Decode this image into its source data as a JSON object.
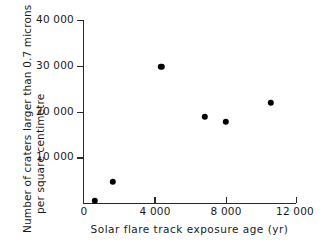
{
  "chart_data": {
    "type": "scatter",
    "title": "",
    "xlabel": "Solar flare track exposure age (yr)",
    "ylabel": "Number of craters larger than 0.7 microns per square centimetre",
    "ylabel_lines": [
      "Number of craters larger than 0.7 microns",
      "per square centimetre"
    ],
    "xlim": [
      0,
      12000
    ],
    "ylim": [
      0,
      40000
    ],
    "xticks": [
      0,
      4000,
      8000,
      12000
    ],
    "xtick_labels": [
      "0",
      "4 000",
      "8 000",
      "12 000"
    ],
    "yticks": [
      10000,
      20000,
      30000,
      40000
    ],
    "ytick_labels": [
      "10 000",
      "20 000",
      "30 000",
      "40 000"
    ],
    "grid": false,
    "legend": false,
    "marker": "filled-circle",
    "marker_color": "#000000",
    "points": [
      {
        "x": 620,
        "y": 450
      },
      {
        "x": 1650,
        "y": 4600
      },
      {
        "x": 4380,
        "y": 29700
      },
      {
        "x": 6830,
        "y": 18800
      },
      {
        "x": 8020,
        "y": 17700
      },
      {
        "x": 10580,
        "y": 21900
      }
    ],
    "x": [
      620,
      1650,
      4380,
      6830,
      8020,
      10580
    ],
    "values": [
      450,
      4600,
      29700,
      18800,
      17700,
      21900
    ]
  },
  "figure": {
    "background": "#ffffff",
    "axis_color": "#2a2a2a",
    "text_color": "#1a1a1a",
    "edge_ghost": ""
  }
}
